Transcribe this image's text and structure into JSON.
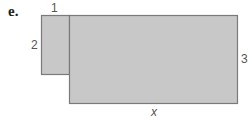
{
  "problem_label": "e.",
  "figure": {
    "fill_color": "#c8c8c8",
    "stroke_color": "#7a7a7a",
    "small_rect": {
      "width_label": "1",
      "height_label": "2"
    },
    "large_rect": {
      "width_label": "x",
      "height_label": "3"
    }
  }
}
